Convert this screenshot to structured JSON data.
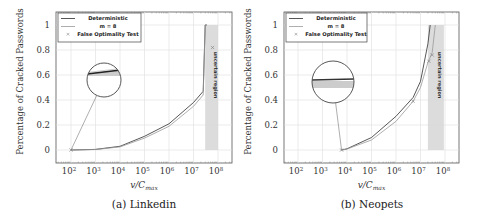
{
  "chart_data": [
    {
      "type": "line",
      "caption": "(a) Linkedin",
      "xlabel": "v/C_max",
      "ylabel": "Percentage of Cracked Passwords",
      "xscale": "log",
      "xlim": [
        30,
        300000000
      ],
      "ylim": [
        -0.1,
        1.1
      ],
      "x_ticks": [
        "10^2",
        "10^3",
        "10^4",
        "10^5",
        "10^6",
        "10^7",
        "10^8"
      ],
      "y_ticks": [
        "0",
        "0.2",
        "0.4",
        "0.6",
        "0.8",
        "1"
      ],
      "grid": true,
      "legend_position": "upper left",
      "legend": [
        "Deterministic",
        "m = 8",
        "False Optimality Test"
      ],
      "uncertain_region": {
        "label": "uncertain region",
        "x_range": [
          30000000,
          100000000
        ]
      },
      "series": [
        {
          "name": "Deterministic",
          "style": "dark-solid",
          "x": [
            100,
            1000,
            10000,
            100000,
            1000000,
            10000000,
            25000000,
            30000000,
            35000000
          ],
          "y": [
            0.0,
            0.005,
            0.03,
            0.11,
            0.21,
            0.38,
            0.47,
            1.0,
            1.0
          ]
        },
        {
          "name": "m = 8",
          "style": "light-solid",
          "x": [
            100,
            1000,
            10000,
            100000,
            1000000,
            10000000,
            25000000,
            30000000,
            35000000
          ],
          "y": [
            0.0,
            0.004,
            0.025,
            0.095,
            0.19,
            0.35,
            0.44,
            1.0,
            1.0
          ]
        },
        {
          "name": "False Optimality Test",
          "style": "marker-x",
          "x": [
            100,
            60000000
          ],
          "y": [
            0.0,
            0.82
          ]
        }
      ],
      "inset": {
        "shape": "circle",
        "zoom_of_x": 100,
        "zoom_of_y": 0.0
      }
    },
    {
      "type": "line",
      "caption": "(b) Neopets",
      "xlabel": "v/C_max",
      "ylabel": "Percentage of Cracked Passwords",
      "xscale": "log",
      "xlim": [
        30,
        300000000
      ],
      "ylim": [
        -0.1,
        1.1
      ],
      "x_ticks": [
        "10^2",
        "10^3",
        "10^4",
        "10^5",
        "10^6",
        "10^7",
        "10^8"
      ],
      "y_ticks": [
        "0",
        "0.2",
        "0.4",
        "0.6",
        "0.8",
        "1"
      ],
      "grid": true,
      "legend_position": "upper left",
      "legend": [
        "Deterministic",
        "m = 8",
        "False Optimality Test"
      ],
      "uncertain_region": {
        "label": "uncertain region",
        "x_range": [
          20000000,
          90000000
        ]
      },
      "series": [
        {
          "name": "Deterministic",
          "style": "dark-solid",
          "x": [
            6000,
            10000,
            100000,
            1000000,
            5000000,
            10000000,
            20000000,
            25000000
          ],
          "y": [
            0.0,
            0.01,
            0.1,
            0.27,
            0.42,
            0.55,
            0.85,
            1.0
          ]
        },
        {
          "name": "m = 8",
          "style": "light-solid",
          "x": [
            6000,
            10000,
            100000,
            1000000,
            5000000,
            10000000,
            20000000,
            30000000,
            40000000
          ],
          "y": [
            0.0,
            0.008,
            0.08,
            0.23,
            0.39,
            0.5,
            0.7,
            0.78,
            1.0
          ]
        },
        {
          "name": "False Optimality Test",
          "style": "marker-x",
          "x": [
            6000,
            5000000,
            22000000,
            30000000
          ],
          "y": [
            0.0,
            0.39,
            0.71,
            0.76
          ]
        }
      ],
      "inset": {
        "shape": "circle",
        "zoom_of_x": 6000,
        "zoom_of_y": 0.0
      }
    }
  ]
}
